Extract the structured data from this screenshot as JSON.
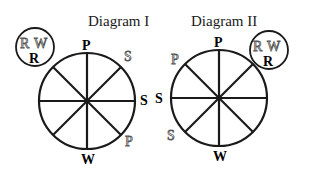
{
  "diagram1": {
    "title": "Diagram I",
    "inset": {
      "top_left": "R",
      "top_right": "W",
      "bottom": "R"
    },
    "labels": {
      "top": "P",
      "top_right": "S",
      "right": "S",
      "bottom_right": "P",
      "bottom": "W"
    }
  },
  "diagram2": {
    "title": "Diagram II",
    "inset": {
      "top_left": "R",
      "top_right": "W",
      "bottom": "R"
    },
    "labels": {
      "top": "P",
      "top_left": "P",
      "left": "S",
      "bottom_left": "S",
      "bottom": "W"
    }
  }
}
